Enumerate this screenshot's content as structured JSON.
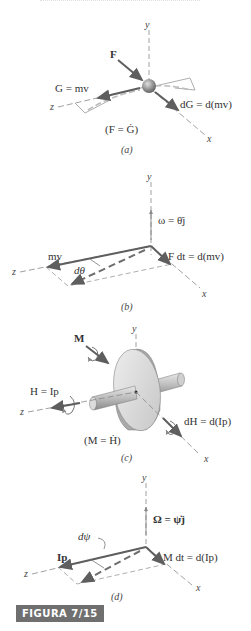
{
  "figure": {
    "label": "FIGURA 7/15",
    "badge_color": "#6f6f6f",
    "top_partial_text": ""
  },
  "axes": {
    "x": "x",
    "y": "y",
    "z": "z"
  },
  "panels": [
    {
      "id": "a",
      "caption": "(a)",
      "labels": {
        "force": "F",
        "momentum": "G = mv",
        "dmomentum": "dG = d(mv)",
        "law": "(F = Ġ)"
      }
    },
    {
      "id": "b",
      "caption": "(b)",
      "labels": {
        "omega": "ω = θ̇j",
        "mv": "mv",
        "dtheta": "dθ",
        "impulse": "F dt = d(mv)"
      }
    },
    {
      "id": "c",
      "caption": "(c)",
      "labels": {
        "moment": "M",
        "angular_momentum": "H = Ip",
        "dH": "dH = d(Ip)",
        "law": "(M = Ḣ)"
      }
    },
    {
      "id": "d",
      "caption": "(d)",
      "labels": {
        "Omega": "Ω = ψ̇j",
        "Ip": "Ip",
        "dpsi": "dψ",
        "angular_impulse": "M dt = d(Ip)"
      }
    }
  ],
  "colors": {
    "vector": "#6a6a6a",
    "axis": "#777777",
    "ghost": "#a8a8a8",
    "sphere": "#8a8a8a",
    "disk": "#d8d8d8"
  }
}
